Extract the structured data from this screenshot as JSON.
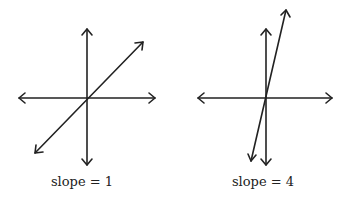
{
  "graphs": [
    {
      "label": "slope = 1",
      "slope": 1
    },
    {
      "label": "slope = 4",
      "slope": 4
    }
  ],
  "colors": {
    "line": "#222222",
    "background": "#ffffff"
  }
}
